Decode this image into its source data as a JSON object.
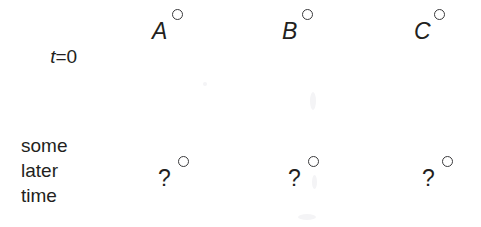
{
  "figure": {
    "background_color": "#ffffff",
    "ink_color": "#231f20",
    "circle_stroke_color": "#3a3a3c"
  },
  "rows": [
    {
      "id": "row-initial",
      "label_prefix": "t",
      "label_suffix": "=0",
      "label_full": "t=0",
      "objects": [
        {
          "id": "object-a",
          "label": "A",
          "marker": "open-circle"
        },
        {
          "id": "object-b",
          "label": "B",
          "marker": "open-circle"
        },
        {
          "id": "object-c",
          "label": "C",
          "marker": "open-circle"
        }
      ]
    },
    {
      "id": "row-later",
      "label_lines": [
        "some",
        "later",
        "time"
      ],
      "objects": [
        {
          "id": "object-a-later",
          "label": "?",
          "marker": "open-circle"
        },
        {
          "id": "object-b-later",
          "label": "?",
          "marker": "open-circle"
        },
        {
          "id": "object-c-later",
          "label": "?",
          "marker": "open-circle"
        }
      ]
    }
  ]
}
